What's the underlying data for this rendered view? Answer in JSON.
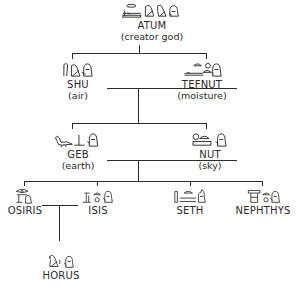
{
  "diagram": {
    "type": "family-tree",
    "nodes": [
      {
        "id": "atum",
        "name": "ATUM",
        "subtitle": "(creator god)",
        "hieroglyph_icon": "atum-hieroglyphs-icon"
      },
      {
        "id": "shu",
        "name": "SHU",
        "subtitle": "(air)",
        "hieroglyph_icon": "shu-hieroglyphs-icon"
      },
      {
        "id": "tefnut",
        "name": "TEFNUT",
        "subtitle": "(moisture)",
        "hieroglyph_icon": "tefnut-hieroglyphs-icon"
      },
      {
        "id": "geb",
        "name": "GEB",
        "subtitle": "(earth)",
        "hieroglyph_icon": "geb-hieroglyphs-icon"
      },
      {
        "id": "nut",
        "name": "NUT",
        "subtitle": "(sky)",
        "hieroglyph_icon": "nut-hieroglyphs-icon"
      },
      {
        "id": "osiris",
        "name": "OSIRIS",
        "subtitle": "",
        "hieroglyph_icon": "osiris-hieroglyphs-icon"
      },
      {
        "id": "isis",
        "name": "ISIS",
        "subtitle": "",
        "hieroglyph_icon": "isis-hieroglyphs-icon"
      },
      {
        "id": "seth",
        "name": "SETH",
        "subtitle": "",
        "hieroglyph_icon": "seth-hieroglyphs-icon"
      },
      {
        "id": "nephthys",
        "name": "NEPHTHYS",
        "subtitle": "",
        "hieroglyph_icon": "nephthys-hieroglyphs-icon"
      },
      {
        "id": "horus",
        "name": "HORUS",
        "subtitle": "",
        "hieroglyph_icon": "horus-hieroglyphs-icon"
      }
    ],
    "edges": [
      {
        "from": "atum",
        "to": "shu",
        "relation": "parent-child"
      },
      {
        "from": "atum",
        "to": "tefnut",
        "relation": "parent-child"
      },
      {
        "from": "shu",
        "to": "tefnut",
        "relation": "couple"
      },
      {
        "from": "shu+tefnut",
        "to": "geb",
        "relation": "parent-child"
      },
      {
        "from": "shu+tefnut",
        "to": "nut",
        "relation": "parent-child"
      },
      {
        "from": "geb",
        "to": "nut",
        "relation": "couple"
      },
      {
        "from": "geb+nut",
        "to": "osiris",
        "relation": "parent-child"
      },
      {
        "from": "geb+nut",
        "to": "isis",
        "relation": "parent-child"
      },
      {
        "from": "geb+nut",
        "to": "seth",
        "relation": "parent-child"
      },
      {
        "from": "geb+nut",
        "to": "nephthys",
        "relation": "parent-child"
      },
      {
        "from": "osiris",
        "to": "isis",
        "relation": "couple"
      },
      {
        "from": "osiris+isis",
        "to": "horus",
        "relation": "parent-child"
      }
    ],
    "line_color": "#2b2b2b",
    "background": "#ffffff"
  }
}
